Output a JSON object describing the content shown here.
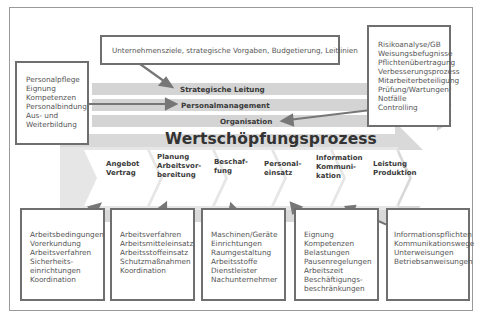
{
  "diagram": {
    "top_box": {
      "text": "Unternehmensziele, strategische  Vorgaben, Budgetierung, Leitlinien"
    },
    "left_box": {
      "lines": [
        "Personalpflege",
        "Eignung",
        "Kompetenzen",
        "Personalbindung",
        "Aus- und",
        "Weiterbildung"
      ]
    },
    "right_box": {
      "lines": [
        "Risikoanalyse/GB",
        "Weisungsbefugnisse",
        "Pflichtenübertragung",
        "Verbesserungsprozess",
        "Mitarbeiterbeteiligung",
        "Prüfung/Wartungen",
        "Notfälle",
        "Controlling"
      ]
    },
    "bands": [
      {
        "label": "Strategische Leitung"
      },
      {
        "label": "Personalmanagement"
      },
      {
        "label": "Organisation"
      }
    ],
    "main_process": {
      "title": "Wertschöpfungsprozess",
      "steps": [
        {
          "lines": [
            "Angebot",
            "Vertrag"
          ]
        },
        {
          "lines": [
            "Planung",
            "Arbeitsvor-",
            "bereitung"
          ]
        },
        {
          "lines": [
            "Beschaf-",
            "fung"
          ]
        },
        {
          "lines": [
            "Personal-",
            "einsatz"
          ]
        },
        {
          "lines": [
            "Information",
            "Kommuni-",
            "kation"
          ]
        },
        {
          "lines": [
            "Leistung",
            "Produktion"
          ]
        }
      ]
    },
    "bottom_boxes": [
      {
        "lines": [
          "Arbeitsbedingungen",
          "Vorerkundung",
          "Arbeitsverfahren",
          "Sicherheits-",
          "einrichtungen",
          "Koordination"
        ]
      },
      {
        "lines": [
          "Arbeitsverfahren",
          "Arbeitsmitteleinsatz",
          "Arbeitsstoffeinsatz",
          "Schutzmaßnahmen",
          "Koordination"
        ]
      },
      {
        "lines": [
          "Maschinen/Geräte",
          "Einrichtungen",
          "Raumgestaltung",
          "Arbeitsstoffe",
          "Dienstleister",
          "Nachunternehmer"
        ]
      },
      {
        "lines": [
          "Eignung",
          "Kompetenzen",
          "Belastungen",
          "Pausenregelungen",
          "Arbeitszeit",
          "Beschäftigungs-",
          "beschränkungen"
        ]
      },
      {
        "lines": [
          "Informationspflichten",
          "Kommunikationswege",
          "Unterweisungen",
          "Betriebsanweisungen"
        ]
      }
    ],
    "colors": {
      "band_fill": "#d3d3d3",
      "big_arrow_fill": "#d9d9d9",
      "box_border": "#6f6f6f",
      "arrow_stroke": "#777777",
      "frame": "#9a9a9a"
    }
  }
}
